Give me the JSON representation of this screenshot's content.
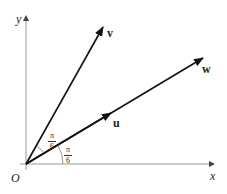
{
  "diagram": {
    "type": "vector-diagram",
    "origin_label": "O",
    "axes": {
      "x_label": "x",
      "y_label": "y"
    },
    "vectors": [
      {
        "name": "v",
        "label": "v",
        "angle_from_x": "π/3"
      },
      {
        "name": "w",
        "label": "w",
        "angle_from_x": "π/6"
      },
      {
        "name": "u",
        "label": "u",
        "angle_from_x": "π/6",
        "note": "unit vector along w"
      }
    ],
    "angles": [
      {
        "between": [
          "u",
          "v"
        ],
        "label_num": "π",
        "label_den": "6"
      },
      {
        "between": [
          "x-axis",
          "u"
        ],
        "label_num": "π",
        "label_den": "6"
      }
    ],
    "colors": {
      "axis": "#888888",
      "vector": "#111111",
      "text": "#222222"
    }
  }
}
